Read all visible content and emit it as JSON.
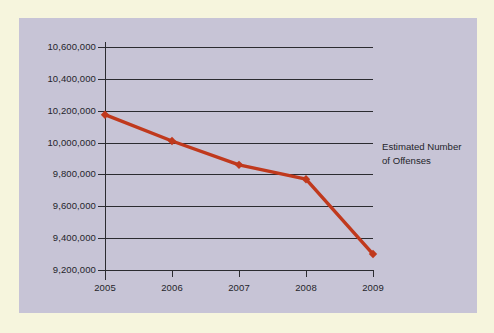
{
  "chart_data": {
    "type": "line",
    "title": "",
    "subtitle": "",
    "xlabel": "",
    "ylabel": "",
    "categories": [
      "2005",
      "2006",
      "2007",
      "2008",
      "2009"
    ],
    "series": [
      {
        "name": "Estimated Number of Offenses",
        "values": [
          10175000,
          10010000,
          9860000,
          9770000,
          9300000
        ],
        "color": "#c0391d",
        "marker": "diamond"
      }
    ],
    "ylim": [
      9200000,
      10600000
    ],
    "y_ticks": [
      9200000,
      9400000,
      9600000,
      9800000,
      10000000,
      10200000,
      10400000,
      10600000
    ],
    "y_tick_labels": [
      "9,200,000",
      "9,400,000",
      "9,600,000",
      "9,800,000",
      "10,000,000",
      "10,200,000",
      "10,400,000",
      "10,600,000"
    ],
    "x_tick_labels": [
      "2005",
      "2006",
      "2007",
      "2008",
      "2009"
    ],
    "grid": "horizontal",
    "legend_position": "right"
  },
  "annotation": {
    "line1": "Estimated Number",
    "line2": "of Offenses"
  },
  "colors": {
    "page_background": "#f6f5dd",
    "panel_background": "#c7c4d6",
    "axis": "#2b2b30",
    "series": "#c0391d",
    "text": "#25252b"
  }
}
